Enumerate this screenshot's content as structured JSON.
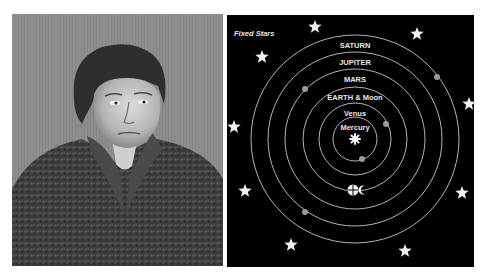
{
  "portrait": {
    "subject": "engraved portrait of a man in a fur-collared coat",
    "style": "grayscale engraving"
  },
  "diagram": {
    "title_label": "Fixed Stars",
    "center_icon": "sun-icon",
    "orbits": [
      {
        "name": "Mercury",
        "label": "Mercury",
        "radius": 22,
        "planet": {
          "x": 135,
          "y": 144
        }
      },
      {
        "name": "Venus",
        "label": "Venus",
        "radius": 36,
        "planet": {
          "x": 159,
          "y": 109
        }
      },
      {
        "name": "Earth",
        "label": "EARTH & Moon",
        "radius": 52,
        "planet": {
          "x": 126,
          "y": 175
        },
        "earth_symbol": true
      },
      {
        "name": "Mars",
        "label": "MARS",
        "radius": 70,
        "planet": {
          "x": 78,
          "y": 74
        }
      },
      {
        "name": "Jupiter",
        "label": "JUPITER",
        "radius": 87,
        "planet": {
          "x": 210,
          "y": 62
        }
      },
      {
        "name": "Saturn",
        "label": "SATURN",
        "radius": 104,
        "planet": {
          "x": 78,
          "y": 197
        }
      }
    ],
    "stars": [
      {
        "x": 88,
        "y": 12
      },
      {
        "x": 190,
        "y": 19
      },
      {
        "x": 35,
        "y": 42
      },
      {
        "x": 242,
        "y": 89
      },
      {
        "x": 7,
        "y": 112
      },
      {
        "x": 18,
        "y": 176
      },
      {
        "x": 235,
        "y": 178
      },
      {
        "x": 64,
        "y": 230
      },
      {
        "x": 178,
        "y": 236
      }
    ],
    "colors": {
      "background": "#000000",
      "orbit": "#c8c8c8",
      "planet": "#9a9a9a",
      "star": "#f2f2f2",
      "text": "#e8e8e8"
    }
  }
}
